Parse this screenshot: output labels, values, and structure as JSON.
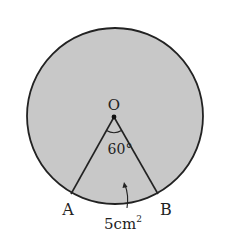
{
  "figure": {
    "type": "circle-sector-diagram",
    "circle": {
      "cx": 115,
      "cy": 116,
      "r": 88,
      "fill": "#c8c8c8",
      "stroke": "#222222"
    },
    "center": {
      "label": "O",
      "x": 114,
      "y": 117
    },
    "points": [
      {
        "label": "A",
        "x": 71,
        "y": 194
      },
      {
        "label": "B",
        "x": 158,
        "y": 194
      }
    ],
    "angle": {
      "label": "60°",
      "value_deg": 60
    },
    "area_annotation": {
      "label": "5cm",
      "superscript": "2",
      "target": "sector AOB"
    }
  }
}
